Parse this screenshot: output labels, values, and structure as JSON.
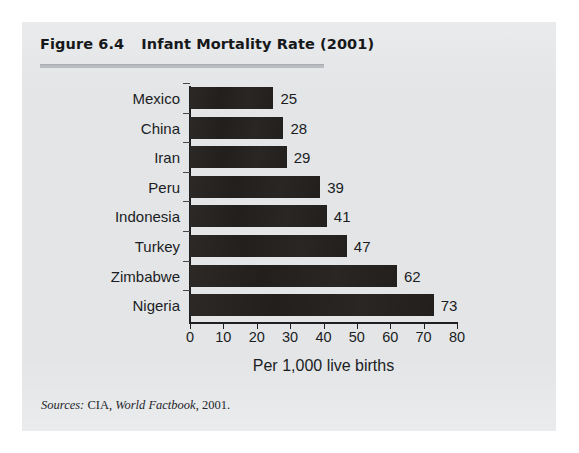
{
  "figure": {
    "number_label": "Figure 6.4",
    "title": "Infant Mortality Rate (2001)",
    "source_lead": "Sources:",
    "source_agency": " CIA, ",
    "source_work": "World Factbook",
    "source_year": ", 2001."
  },
  "chart_data": {
    "type": "bar",
    "orientation": "horizontal",
    "title": "Infant Mortality Rate (2001)",
    "categories": [
      "Mexico",
      "China",
      "Iran",
      "Peru",
      "Indonesia",
      "Turkey",
      "Zimbabwe",
      "Nigeria"
    ],
    "values": [
      25,
      28,
      29,
      39,
      41,
      47,
      62,
      73
    ],
    "value_labels": [
      "25",
      "28",
      "29",
      "39",
      "41",
      "47",
      "62",
      "73"
    ],
    "xlabel": "Per 1,000 live births",
    "ylabel": "",
    "xlim": [
      0,
      80
    ],
    "xticks": [
      0,
      10,
      20,
      30,
      40,
      50,
      60,
      70,
      80
    ],
    "xtick_labels": [
      "0",
      "10",
      "20",
      "30",
      "40",
      "50",
      "60",
      "70",
      "80"
    ],
    "grid": false,
    "legend": false,
    "bar_color": "#231f1c",
    "panel_color": "#e3e5e7",
    "text_color": "#1b1d1f"
  }
}
